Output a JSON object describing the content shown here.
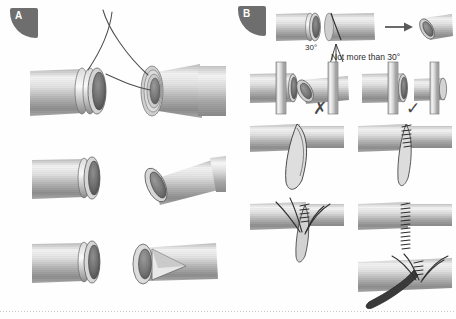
{
  "figure": {
    "background_color": "#fefefe",
    "line_color": "#3a3a3a",
    "tube_light": "#f2f2f2",
    "tube_mid": "#b9b9b9",
    "tube_dark": "#7d7d7d",
    "badge_color": "#6e6e6e"
  },
  "panels": [
    {
      "id": "A",
      "label": "A",
      "description": "Two tube ends approximated with stay sutures crossing above; three stacked rows of paired tube-end views."
    },
    {
      "id": "B",
      "label": "B",
      "description": "Tube bevel cutting angle guidance, correct and incorrect orientations, and suturing sequence."
    }
  ],
  "annotations": {
    "angle_label": "30°",
    "angle_rule": "Not more than 30°",
    "incorrect_mark": "✗",
    "correct_mark": "✓"
  },
  "icons": {
    "arrow": "arrow-right-icon",
    "cross": "cross-mark-icon",
    "check": "check-mark-icon"
  }
}
